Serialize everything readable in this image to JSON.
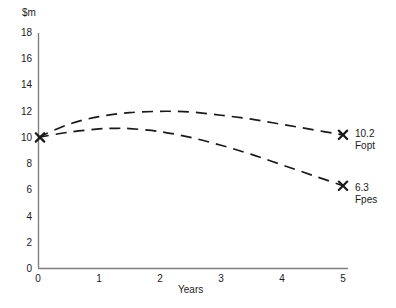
{
  "chart_data": {
    "type": "line",
    "title": "",
    "subtitle": "",
    "xlabel": "Years",
    "ylabel": "$m",
    "xlim": [
      0,
      5
    ],
    "ylim": [
      0,
      18
    ],
    "grid": false,
    "legend": "none",
    "xticks": [
      "0",
      "1",
      "2",
      "3",
      "4",
      "5"
    ],
    "yticks": [
      "0",
      "2",
      "4",
      "6",
      "8",
      "10",
      "12",
      "14",
      "16",
      "18"
    ],
    "linestyle": "dashed",
    "series": [
      {
        "name": "Fopt",
        "end_value_label": "10.2",
        "end_value": 10.2,
        "start_value": 10.0,
        "peak_value": 12.0,
        "peak_x": 2.2,
        "x": [
          0,
          0.5,
          1,
          1.5,
          2,
          2.2,
          2.5,
          3,
          3.5,
          4,
          4.5,
          5
        ],
        "values": [
          10.0,
          11.0,
          11.6,
          11.9,
          12.0,
          12.0,
          11.95,
          11.7,
          11.4,
          11.0,
          10.6,
          10.2
        ],
        "marker": "x",
        "color": "#1a1a1a"
      },
      {
        "name": "Fpes",
        "end_value_label": "6.3",
        "end_value": 6.3,
        "start_value": 10.0,
        "peak_value": 10.7,
        "peak_x": 1.3,
        "x": [
          0,
          0.5,
          1,
          1.3,
          1.5,
          2,
          2.5,
          3,
          3.5,
          4,
          4.5,
          5
        ],
        "values": [
          10.0,
          10.4,
          10.65,
          10.7,
          10.68,
          10.45,
          10.0,
          9.4,
          8.7,
          7.9,
          7.1,
          6.3
        ],
        "marker": "x",
        "color": "#1a1a1a"
      }
    ],
    "annotations": [
      {
        "text": "10.2",
        "sub": "Fopt",
        "x": 5,
        "y": 10.2
      },
      {
        "text": "6.3",
        "sub": "Fpes",
        "x": 5,
        "y": 6.3
      }
    ],
    "origin_marker": {
      "x": 0,
      "y": 10,
      "marker": "x"
    },
    "colors": {
      "axis": "#808080",
      "line": "#1a1a1a",
      "text": "#1a1a1a",
      "background": "#ffffff"
    }
  }
}
